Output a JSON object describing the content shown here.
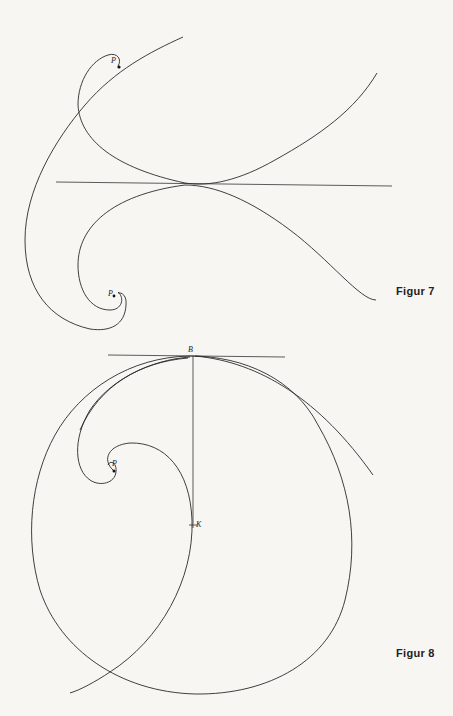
{
  "figures": [
    {
      "caption": "Figur 7",
      "labels": {
        "p_upper": "P",
        "p_lower": "P"
      }
    },
    {
      "caption": "Figur 8",
      "labels": {
        "b": "B",
        "p": "P",
        "k": "K"
      }
    }
  ],
  "colors": {
    "paper": "#f7f6f3",
    "ink": "#2a2a2a"
  }
}
